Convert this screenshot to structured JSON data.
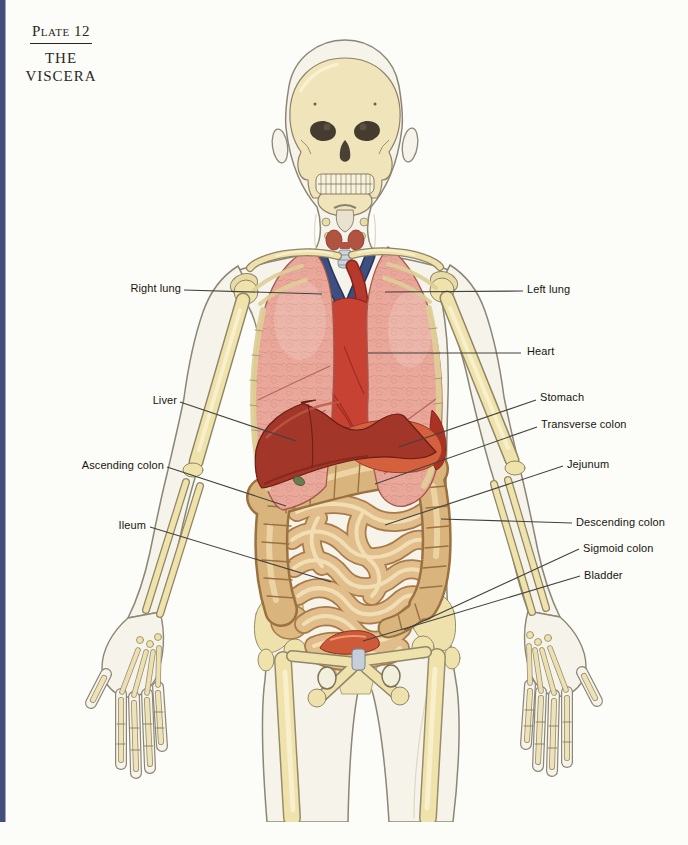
{
  "header": {
    "plate_label": "Plate 12",
    "title_line_1": "THE",
    "title_line_2": "VISCERA"
  },
  "labels": {
    "right_lung": "Right lung",
    "left_lung": "Left lung",
    "heart": "Heart",
    "liver": "Liver",
    "stomach": "Stomach",
    "transverse_colon": "Transverse colon",
    "ascending_colon": "Ascending colon",
    "jejunum": "Jejunum",
    "ileum": "Ileum",
    "descending_colon": "Descending colon",
    "sigmoid_colon": "Sigmoid colon",
    "bladder": "Bladder"
  },
  "palette": {
    "page_edge_stripe": "#414f79",
    "background": "#fcfcf8",
    "body_outline": "#8b8675",
    "body_ghost": "#f6f4ea",
    "bone": "#efe2ab",
    "lung_pink": "#eaa89b",
    "heart_red": "#c84234",
    "liver_red": "#a13629",
    "stomach_orange": "#d4603e",
    "small_intestine_tan": "#e0bd8b",
    "colon_tan": "#d9b47c",
    "bladder_orange": "#cd5a38",
    "vessel_blue": "#3c4f80",
    "label_text": "#17160f"
  }
}
